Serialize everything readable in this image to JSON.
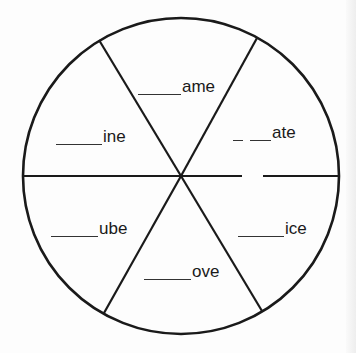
{
  "worksheet": {
    "type": "word-wheel",
    "stroke_color": "#1a1a1a",
    "circle": {
      "cx": 181,
      "cy": 176,
      "r": 158
    },
    "segments": [
      {
        "id": "top",
        "blank_count": 1,
        "ending": "ame"
      },
      {
        "id": "upper-right",
        "blank_count": 2,
        "ending": "ate"
      },
      {
        "id": "lower-right",
        "blank_count": 1,
        "ending": "ice"
      },
      {
        "id": "bottom",
        "blank_count": 1,
        "ending": "ove"
      },
      {
        "id": "lower-left",
        "blank_count": 1,
        "ending": "ube"
      },
      {
        "id": "upper-left",
        "blank_count": 1,
        "ending": "ine"
      }
    ]
  }
}
